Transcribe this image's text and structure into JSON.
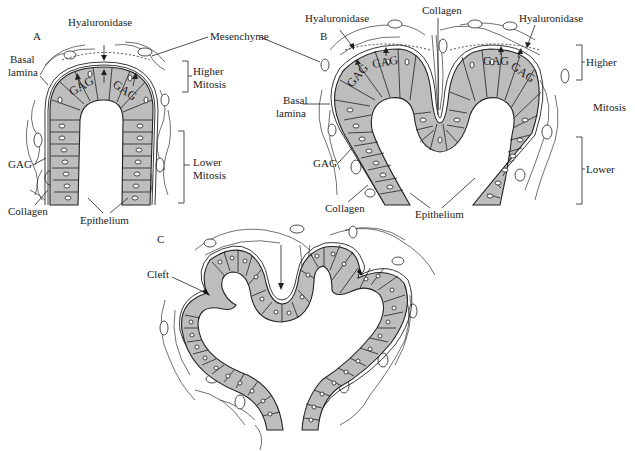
{
  "figure": {
    "colors": {
      "epithelium_fill": "#bdbdbd",
      "ink": "#222222",
      "background": "#ffffff"
    }
  },
  "panel_a": {
    "letter": "A",
    "labels": {
      "hyaluronidase": "Hyaluronidase",
      "mesenchyme": "Mesenchyme",
      "basal_lamina_1": "Basal",
      "basal_lamina_2": "lamina",
      "higher_1": "Higher",
      "higher_2": "Mitosis",
      "lower_1": "Lower",
      "lower_2": "Mitosis",
      "gag_left": "GAG",
      "gag_in_1": "GAG",
      "gag_in_2": "GAG",
      "collagen": "Collagen",
      "epithelium": "Epithelium"
    }
  },
  "panel_b": {
    "letter": "B",
    "labels": {
      "hyaluronidase_left": "Hyaluronidase",
      "hyaluronidase_right": "Hyaluronidase",
      "collagen_top": "Collagen",
      "basal_lamina_1": "Basal",
      "basal_lamina_2": "lamina",
      "gag_left": "GAG",
      "gag_in_1": "GAG",
      "gag_in_2": "GAG",
      "gag_in_3": "GAG",
      "gag_in_4": "GAG",
      "higher": "Higher",
      "mitosis": "Mitosis",
      "lower": "Lower",
      "collagen_bottom": "Collagen",
      "epithelium": "Epithelium"
    }
  },
  "panel_c": {
    "letter": "C",
    "labels": {
      "cleft": "Cleft"
    }
  }
}
